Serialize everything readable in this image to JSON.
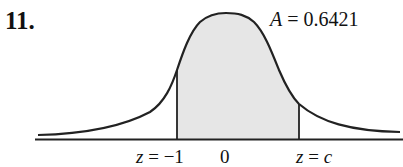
{
  "problem": {
    "number": "11."
  },
  "figure": {
    "type": "standard-normal-curve",
    "area_label": {
      "var": "A",
      "eq": " = ",
      "value": "0.6421"
    },
    "shaded_region": {
      "from": "z = -1",
      "to": "z = c",
      "fill": "#e6e6e6"
    },
    "axis_labels": {
      "left": {
        "var": "z",
        "eq": " = ",
        "value": "−1"
      },
      "center": "0",
      "right": {
        "var": "z",
        "eq": " = ",
        "value": "c"
      }
    },
    "colors": {
      "curve": "#222222",
      "shade": "#e6e6e6",
      "axis": "#222222"
    }
  }
}
